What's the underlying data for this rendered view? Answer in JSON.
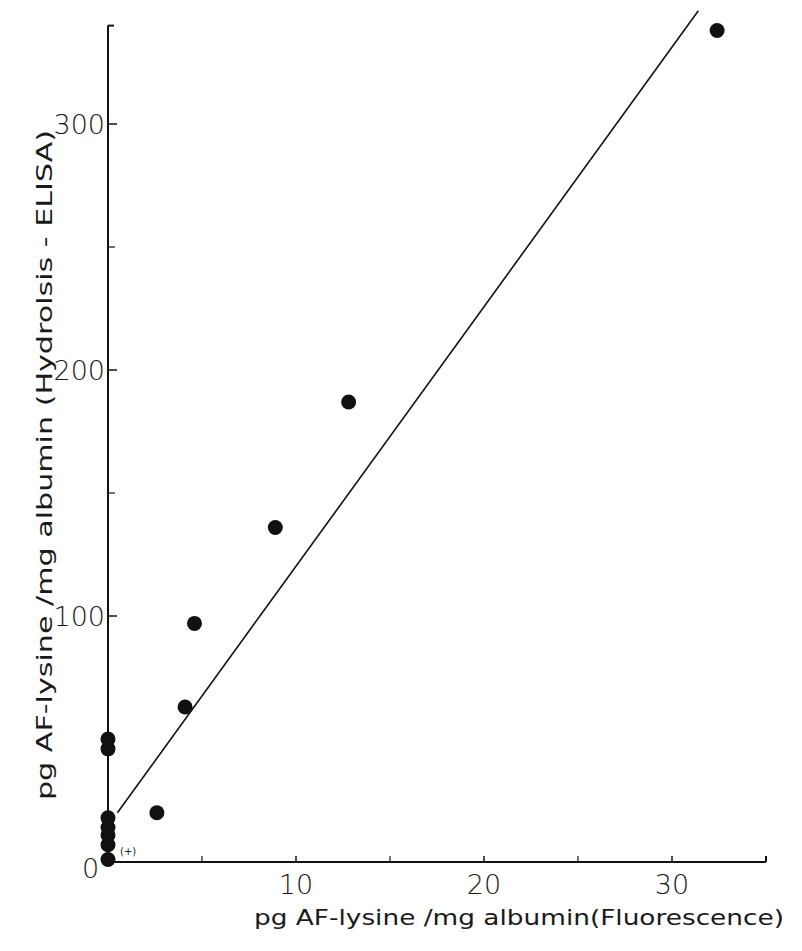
{
  "chart_data": {
    "type": "scatter",
    "title": "",
    "xlabel": "pg  AF-lysine /mg  albumin(Fluorescence)",
    "ylabel": "pg  AF-lysine /mg  albumin (Hydrolsis - ELISA)",
    "xlim": [
      0,
      35
    ],
    "ylim": [
      0,
      340
    ],
    "x_ticks": [
      0,
      10,
      20,
      30
    ],
    "x_tick_labels": [
      "0",
      "10",
      "20",
      "30"
    ],
    "x_minor_ticks": [
      5,
      15,
      25
    ],
    "y_ticks": [
      100,
      200,
      300
    ],
    "y_tick_labels": [
      "100",
      "200",
      "300"
    ],
    "y_minor_ticks": [
      50,
      150,
      250
    ],
    "origin_label": "0",
    "grid": false,
    "legend": null,
    "annotations": [
      {
        "text": "(+)",
        "x": 0.9,
        "y": 4
      }
    ],
    "series": [
      {
        "name": "samples",
        "marker": "filled-circle",
        "color": "#111111",
        "points": [
          {
            "x": 0,
            "y": 1
          },
          {
            "x": 0,
            "y": 7
          },
          {
            "x": 0,
            "y": 11
          },
          {
            "x": 0,
            "y": 14
          },
          {
            "x": 0,
            "y": 18
          },
          {
            "x": 0,
            "y": 46
          },
          {
            "x": 0,
            "y": 50
          },
          {
            "x": 2.6,
            "y": 20
          },
          {
            "x": 4.1,
            "y": 63
          },
          {
            "x": 4.6,
            "y": 97
          },
          {
            "x": 8.9,
            "y": 136
          },
          {
            "x": 12.8,
            "y": 187
          },
          {
            "x": 32.4,
            "y": 338
          }
        ]
      }
    ],
    "regression_line": {
      "x_start": 0.5,
      "y_start": 20,
      "x_end": 31.4,
      "y_end": 346
    }
  }
}
